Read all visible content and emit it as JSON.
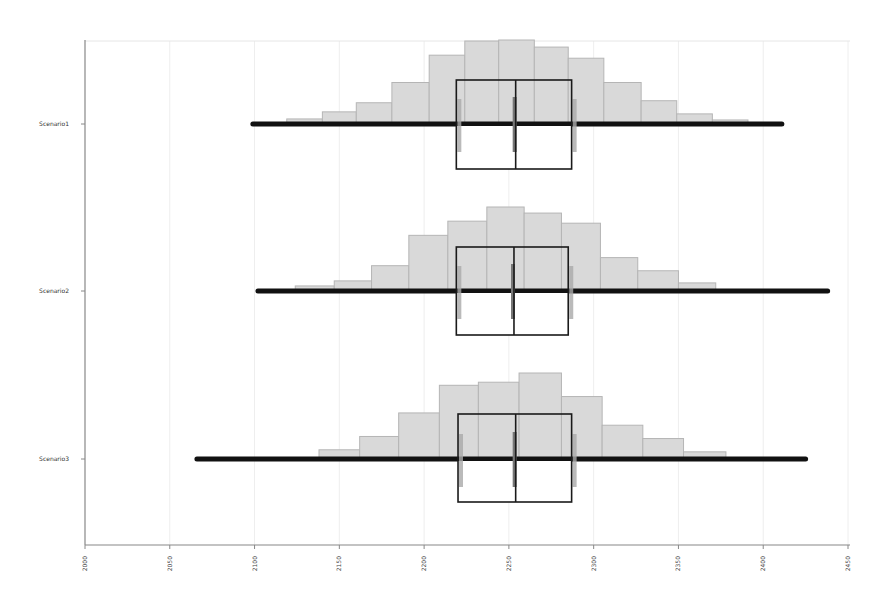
{
  "chart_data": {
    "type": "box-histogram",
    "title": "",
    "xlabel": "",
    "ylabel": "",
    "xlim": [
      2000,
      2450
    ],
    "x_ticks": [
      2000,
      2050,
      2100,
      2150,
      2200,
      2250,
      2300,
      2350,
      2400,
      2450
    ],
    "grid": true,
    "orientation": "horizontal",
    "categories": [
      "Scenario1",
      "Scenario2",
      "Scenario3"
    ],
    "series": [
      {
        "name": "Scenario1",
        "whisker_min": 2099,
        "q1": 2219,
        "median": 2254,
        "q3": 2287,
        "whisker_max": 2411,
        "histogram": {
          "bin_edges": [
            2119,
            2140,
            2160,
            2181,
            2203,
            2224,
            2244,
            2265,
            2285,
            2306,
            2328,
            2349,
            2370,
            2391
          ],
          "relative_heights": [
            5,
            12,
            21,
            41,
            68,
            82,
            83,
            76,
            65,
            41,
            23,
            10,
            4
          ]
        }
      },
      {
        "name": "Scenario2",
        "whisker_min": 2102,
        "q1": 2219,
        "median": 2253,
        "q3": 2285,
        "whisker_max": 2438,
        "histogram": {
          "bin_edges": [
            2124,
            2147,
            2169,
            2191,
            2214,
            2237,
            2259,
            2281,
            2304,
            2326,
            2350,
            2372
          ],
          "relative_heights": [
            5,
            10,
            25,
            55,
            69,
            83,
            77,
            67,
            33,
            20,
            8
          ]
        }
      },
      {
        "name": "Scenario3",
        "whisker_min": 2066,
        "q1": 2220,
        "median": 2254,
        "q3": 2287,
        "whisker_max": 2425,
        "histogram": {
          "bin_edges": [
            2138,
            2162,
            2185,
            2209,
            2232,
            2256,
            2281,
            2305,
            2329,
            2353,
            2378
          ],
          "relative_heights": [
            9,
            22,
            45,
            72,
            75,
            84,
            61,
            33,
            20,
            7
          ]
        }
      }
    ]
  },
  "colors": {
    "histogram_fill": "#d9d9d9",
    "histogram_stroke": "#b5b5b5",
    "whisker": "#111111",
    "box_stroke": "#1a1a1a",
    "median_marker": "#777777",
    "grid": "#eeeeee",
    "axis": "#888888"
  }
}
